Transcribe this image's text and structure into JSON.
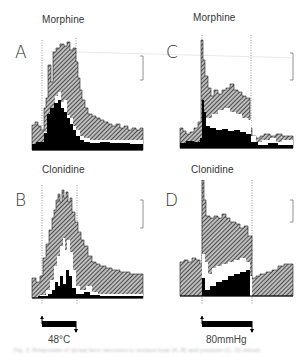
{
  "panels": [
    {
      "id": "A",
      "letter": "A",
      "title": "Morphine"
    },
    {
      "id": "B",
      "letter": "B",
      "title": "Clonidine"
    },
    {
      "id": "C",
      "letter": "C",
      "title": "Morphine"
    },
    {
      "id": "D",
      "letter": "D",
      "title": "Clonidine"
    }
  ],
  "stimuli": {
    "left": "48°C",
    "right": "80mmHg"
  },
  "caption": "Fig. 3. Responses of dorsal horn neurones to noxious heat (A, B) and pressure (C, D) stimuli"
}
